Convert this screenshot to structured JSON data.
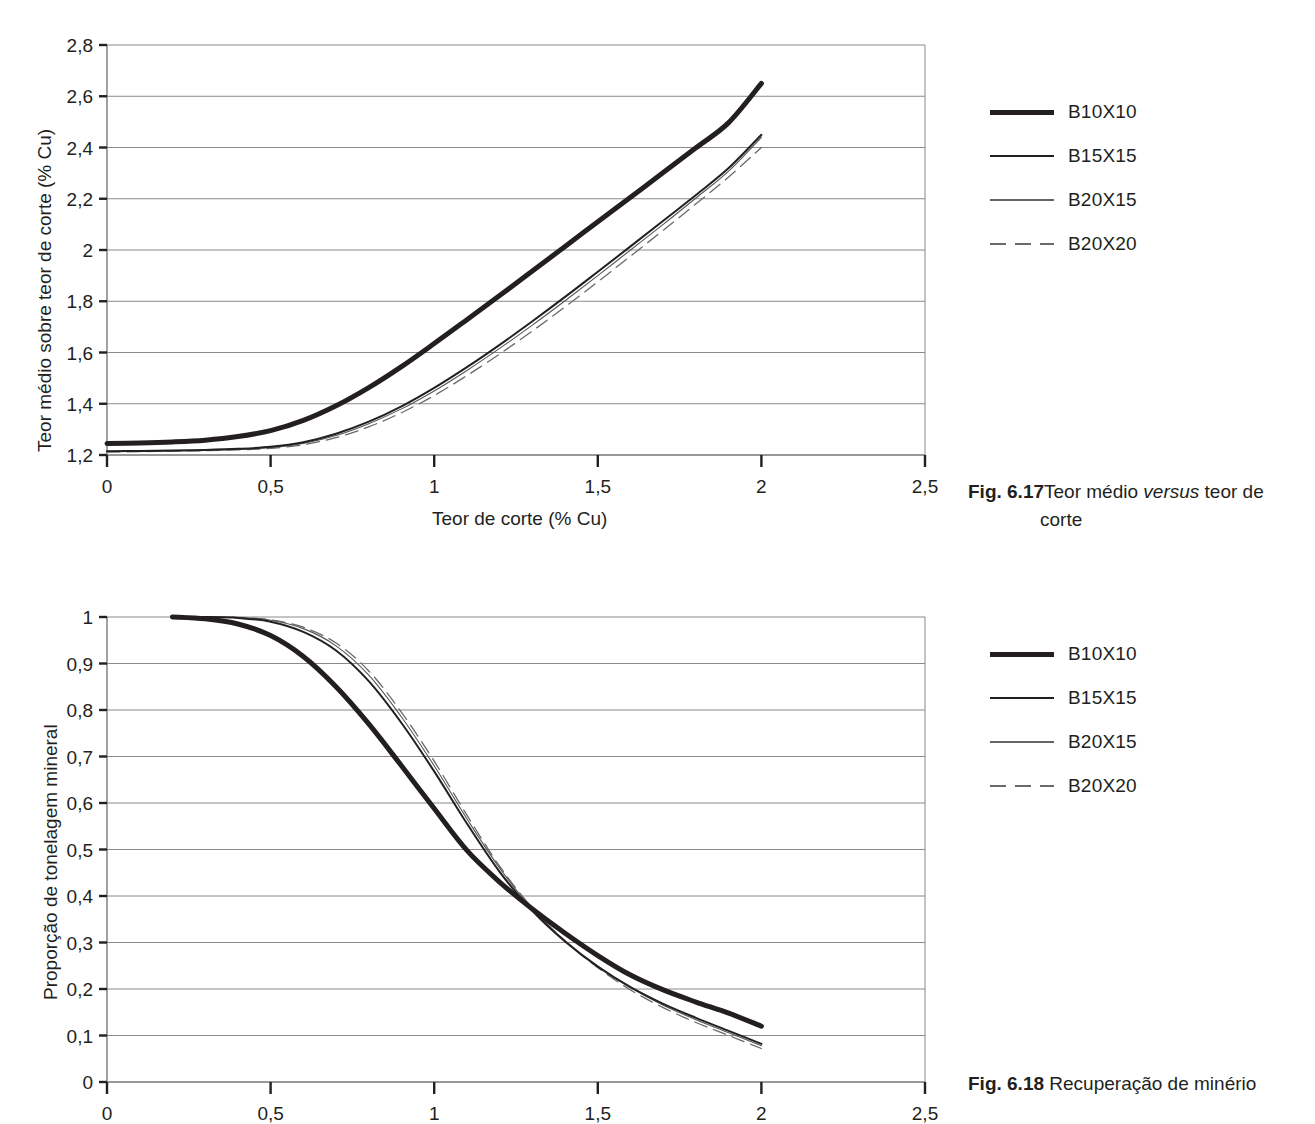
{
  "page": {
    "background": "#ffffff",
    "ink": "#231f20",
    "grid_color": "#808080"
  },
  "figures": [
    {
      "id": "fig-6-17",
      "caption_prefix": "Fig. 6.17",
      "caption_line1": "Teor médio ",
      "caption_italic": "versus",
      "caption_line1b": " teor de",
      "caption_line2": "corte",
      "legend": [
        {
          "label": "B10X10",
          "style": "thick-solid"
        },
        {
          "label": "B15X15",
          "style": "medium-solid"
        },
        {
          "label": "B20X15",
          "style": "thin-solid"
        },
        {
          "label": "B20X20",
          "style": "dashed"
        }
      ],
      "chart_data": {
        "type": "line",
        "title": "",
        "xlabel": "Teor de corte (% Cu)",
        "ylabel": "Teor médio sobre teor de corte (% Cu)",
        "xlim": [
          0,
          2.5
        ],
        "ylim": [
          1.2,
          2.8
        ],
        "xticks": [
          0,
          0.5,
          1,
          1.5,
          2,
          2.5
        ],
        "xticklabels": [
          "0",
          "0,5",
          "1",
          "1,5",
          "2",
          "2,5"
        ],
        "yticks": [
          1.2,
          1.4,
          1.6,
          1.8,
          2.0,
          2.2,
          2.4,
          2.6,
          2.8
        ],
        "yticklabels": [
          "1,2",
          "1,4",
          "1,6",
          "1,8",
          "2",
          "2,2",
          "2,4",
          "2,6",
          "2,8"
        ],
        "grid": "horizontal",
        "legend_position": "right",
        "x": [
          0,
          0.1,
          0.2,
          0.3,
          0.4,
          0.5,
          0.6,
          0.7,
          0.8,
          0.9,
          1.0,
          1.1,
          1.2,
          1.3,
          1.4,
          1.5,
          1.6,
          1.7,
          1.8,
          1.9,
          2.0
        ],
        "series": [
          {
            "name": "B10X10",
            "style": "thick-solid",
            "values": [
              1.245,
              1.247,
              1.251,
              1.258,
              1.272,
              1.295,
              1.335,
              1.392,
              1.463,
              1.545,
              1.635,
              1.728,
              1.822,
              1.918,
              2.014,
              2.11,
              2.206,
              2.302,
              2.399,
              2.497,
              2.65
            ]
          },
          {
            "name": "B15X15",
            "style": "medium-solid",
            "values": [
              1.215,
              1.216,
              1.218,
              1.22,
              1.224,
              1.232,
              1.25,
              1.283,
              1.33,
              1.39,
              1.462,
              1.543,
              1.63,
              1.722,
              1.817,
              1.915,
              2.014,
              2.114,
              2.215,
              2.32,
              2.45
            ]
          },
          {
            "name": "B20X15",
            "style": "thin-solid",
            "values": [
              1.213,
              1.214,
              1.216,
              1.218,
              1.222,
              1.229,
              1.245,
              1.276,
              1.322,
              1.38,
              1.45,
              1.53,
              1.616,
              1.707,
              1.802,
              1.9,
              2.0,
              2.1,
              2.203,
              2.308,
              2.44
            ]
          },
          {
            "name": "B20X20",
            "style": "dashed",
            "values": [
              1.212,
              1.213,
              1.215,
              1.217,
              1.22,
              1.226,
              1.24,
              1.268,
              1.31,
              1.365,
              1.432,
              1.51,
              1.594,
              1.684,
              1.778,
              1.876,
              1.976,
              2.077,
              2.18,
              2.285,
              2.4
            ]
          }
        ]
      }
    },
    {
      "id": "fig-6-18",
      "caption_prefix": "Fig. 6.18",
      "caption_line1": " Recuperação de minério",
      "legend": [
        {
          "label": "B10X10",
          "style": "thick-solid"
        },
        {
          "label": "B15X15",
          "style": "medium-solid"
        },
        {
          "label": "B20X15",
          "style": "thin-solid"
        },
        {
          "label": "B20X20",
          "style": "dashed"
        }
      ],
      "chart_data": {
        "type": "line",
        "title": "",
        "xlabel": "",
        "ylabel": "Proporção de tonelagem mineral",
        "xlim": [
          0,
          2.5
        ],
        "ylim": [
          0,
          1
        ],
        "xticks": [
          0,
          0.5,
          1,
          1.5,
          2,
          2.5
        ],
        "xticklabels": [
          "0",
          "0,5",
          "1",
          "1,5",
          "2",
          "2,5"
        ],
        "yticks": [
          0,
          0.1,
          0.2,
          0.3,
          0.4,
          0.5,
          0.6,
          0.7,
          0.8,
          0.9,
          1
        ],
        "yticklabels": [
          "0",
          "0,1",
          "0,2",
          "0,3",
          "0,4",
          "0,5",
          "0,6",
          "0,7",
          "0,8",
          "0,9",
          "1"
        ],
        "grid": "horizontal",
        "legend_position": "right",
        "x": [
          0.2,
          0.3,
          0.4,
          0.5,
          0.6,
          0.7,
          0.8,
          0.9,
          1.0,
          1.1,
          1.2,
          1.3,
          1.4,
          1.5,
          1.6,
          1.7,
          1.8,
          1.9,
          2.0
        ],
        "series": [
          {
            "name": "B10X10",
            "style": "thick-solid",
            "values": [
              1.0,
              0.996,
              0.985,
              0.96,
              0.915,
              0.85,
              0.77,
              0.68,
              0.588,
              0.498,
              0.43,
              0.372,
              0.32,
              0.272,
              0.23,
              0.198,
              0.172,
              0.148,
              0.12
            ]
          },
          {
            "name": "B15X15",
            "style": "medium-solid",
            "values": [
              1.0,
              1.0,
              0.998,
              0.99,
              0.968,
              0.928,
              0.862,
              0.772,
              0.668,
              0.556,
              0.452,
              0.368,
              0.302,
              0.248,
              0.204,
              0.168,
              0.138,
              0.11,
              0.082
            ]
          },
          {
            "name": "B20X15",
            "style": "thin-solid",
            "values": [
              1.0,
              1.0,
              0.999,
              0.993,
              0.975,
              0.938,
              0.875,
              0.785,
              0.68,
              0.566,
              0.46,
              0.372,
              0.304,
              0.249,
              0.203,
              0.165,
              0.134,
              0.106,
              0.078
            ]
          },
          {
            "name": "B20X20",
            "style": "dashed",
            "values": [
              1.0,
              1.0,
              0.999,
              0.994,
              0.978,
              0.944,
              0.884,
              0.795,
              0.69,
              0.574,
              0.464,
              0.374,
              0.303,
              0.246,
              0.198,
              0.16,
              0.128,
              0.1,
              0.072
            ]
          }
        ]
      }
    }
  ]
}
